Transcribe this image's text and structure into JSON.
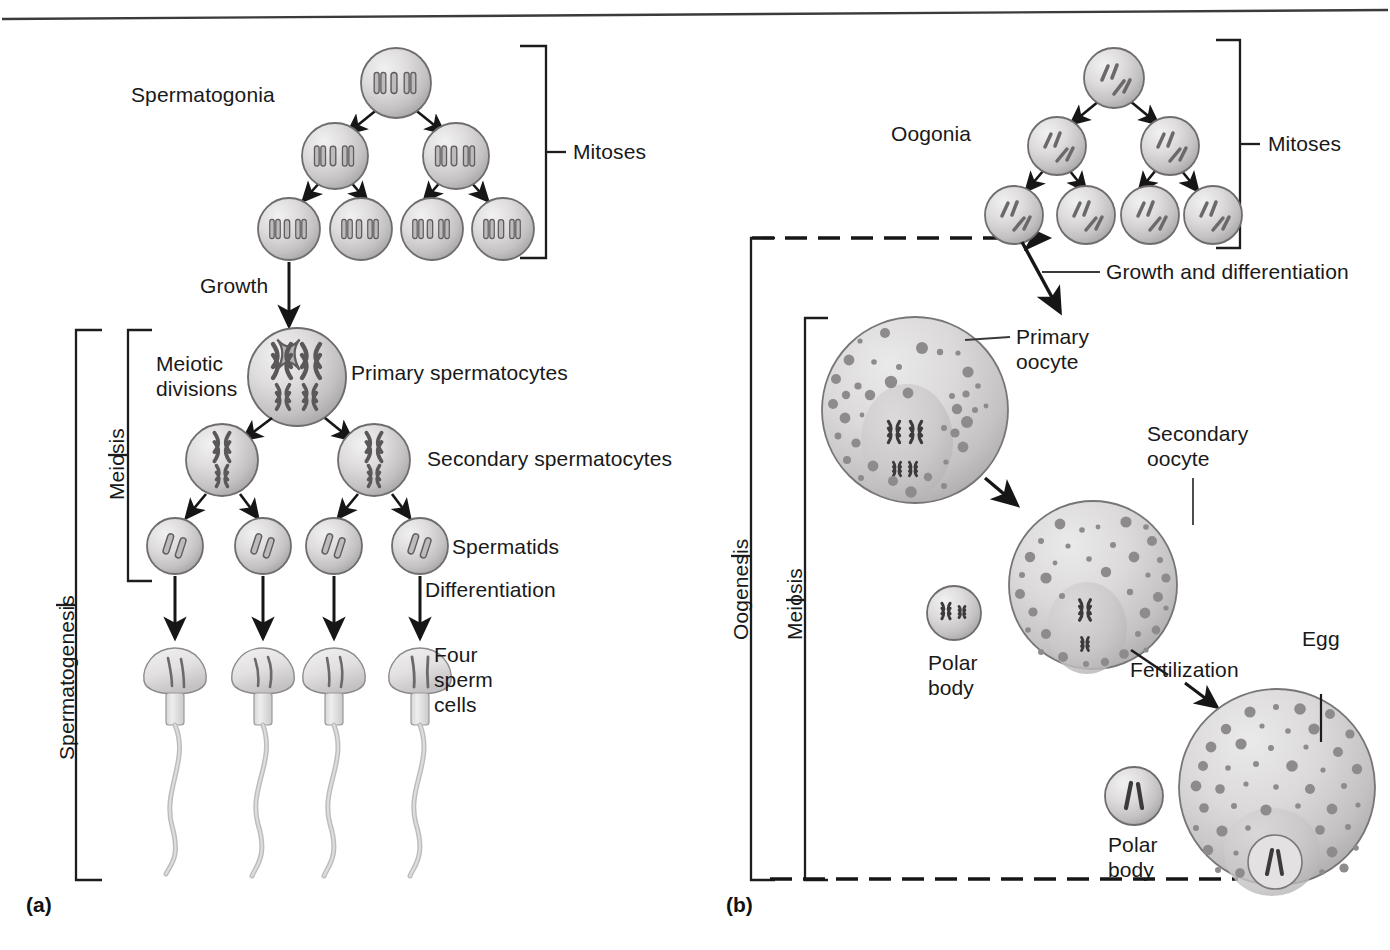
{
  "figure": {
    "panels": [
      {
        "tag": "(a)",
        "name": "spermatogenesis"
      },
      {
        "tag": "(b)",
        "name": "oogenesis"
      }
    ],
    "colors": {
      "cell_fill_light": "#eceaea",
      "cell_fill_mid": "#c9c7c7",
      "cell_fill_dark": "#a8a6a6",
      "cell_stroke": "#6e6c6c",
      "chromosome": "#6a6868",
      "chromosome_dark": "#3c3a3a",
      "granule": "#8f8d8d",
      "line": "#1d1d1d",
      "text": "#191919",
      "sperm_body": "#dedcdc",
      "nucleus": "#c2c0c0"
    }
  },
  "panel_a": {
    "tag": "(a)",
    "labels": {
      "spermatogonia": "Spermatogonia",
      "mitoses": "Mitoses",
      "growth": "Growth",
      "meiotic_divisions_line1": "Meiotic",
      "meiotic_divisions_line2": "divisions",
      "primary_spermatocytes": "Primary spermatocytes",
      "secondary_spermatocytes": "Secondary spermatocytes",
      "spermatids": "Spermatids",
      "differentiation": "Differentiation",
      "four_sperm_line1": "Four",
      "four_sperm_line2": "sperm",
      "four_sperm_line3": "cells",
      "meiosis_bracket": "Meiosis",
      "spermatogenesis_bracket": "Spermatogenesis"
    },
    "counts": {
      "mitosis_generations": 3,
      "spermatogonia_row1": 1,
      "spermatogonia_row2": 2,
      "spermatogonia_row3": 4,
      "primary_spermatocytes": 1,
      "secondary_spermatocytes": 2,
      "spermatids": 4,
      "sperm_cells": 4,
      "chromosomes_diploid": 4,
      "chromosomes_haploid": 2
    }
  },
  "panel_b": {
    "tag": "(b)",
    "labels": {
      "oogonia": "Oogonia",
      "mitoses": "Mitoses",
      "growth_and_differentiation": "Growth and differentiation",
      "primary_oocyte_line1": "Primary",
      "primary_oocyte_line2": "oocyte",
      "secondary_oocyte_line1": "Secondary",
      "secondary_oocyte_line2": "oocyte",
      "polar_body_1_line1": "Polar",
      "polar_body_1_line2": "body",
      "polar_body_2_line1": "Polar",
      "polar_body_2_line2": "body",
      "fertilization": "Fertilization",
      "egg": "Egg",
      "oogenesis_bracket": "Oogenesis",
      "meiosis_bracket": "Meiosis"
    },
    "counts": {
      "mitosis_generations": 3,
      "oogonia_row1": 1,
      "oogonia_row2": 2,
      "oogonia_row3": 4,
      "primary_oocyte": 1,
      "secondary_oocyte": 1,
      "polar_bodies": 2,
      "egg": 1
    }
  }
}
